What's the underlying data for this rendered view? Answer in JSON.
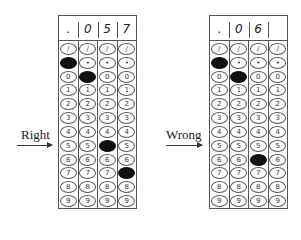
{
  "examples": [
    {
      "label": "Right",
      "header": [
        ".",
        "0",
        "5",
        "7"
      ],
      "rows": [
        "/",
        ".",
        "0",
        "1",
        "2",
        "3",
        "4",
        "5",
        "6",
        "7",
        "8",
        "9"
      ],
      "filled": [
        [
          0,
          1
        ],
        [
          1,
          2
        ],
        [
          2,
          7
        ],
        [
          3,
          9
        ]
      ]
    },
    {
      "label": "Wrong",
      "header": [
        ".",
        "0",
        "6",
        ""
      ],
      "rows": [
        "/",
        ".",
        "0",
        "1",
        "2",
        "3",
        "4",
        "5",
        "6",
        "7",
        "8",
        "9"
      ],
      "filled": [
        [
          0,
          1
        ],
        [
          1,
          2
        ],
        [
          2,
          8
        ]
      ]
    }
  ]
}
